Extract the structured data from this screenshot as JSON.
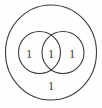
{
  "figure": {
    "name": "two-set-venn-diagram",
    "background_color": "#fefefe",
    "stroke_color": "#3a3a3a",
    "text_color": "#2f2f2f",
    "width": 102,
    "height": 108
  },
  "chart_data": {
    "type": "venn",
    "title": "",
    "subtitle": "",
    "xlabel": "",
    "ylabel": "",
    "grid": false,
    "legend": false,
    "set_count": 2,
    "universe": {
      "label": "",
      "shape": "ellipse",
      "cx": 51,
      "cy": 52.5,
      "rx": 45.5,
      "ry": 47.5
    },
    "sets": [
      {
        "name": "left-set",
        "label": "",
        "shape": "circle",
        "cx": 39.5,
        "cy": 52.5,
        "r": 21.0
      },
      {
        "name": "right-set",
        "label": "",
        "shape": "circle",
        "cx": 63.0,
        "cy": 52.5,
        "r": 21.0
      }
    ],
    "regions": [
      {
        "name": "left-only",
        "value": "1",
        "x": 29,
        "y": 55.5
      },
      {
        "name": "intersection",
        "value": "1",
        "x": 51,
        "y": 55.5
      },
      {
        "name": "right-only",
        "value": "1",
        "x": 72,
        "y": 55.5
      },
      {
        "name": "outside-both",
        "value": "1",
        "x": 51,
        "y": 87.5
      }
    ],
    "values": [
      1,
      1,
      1,
      1
    ],
    "categories": [
      "left-only",
      "intersection",
      "right-only",
      "outside-both"
    ]
  }
}
